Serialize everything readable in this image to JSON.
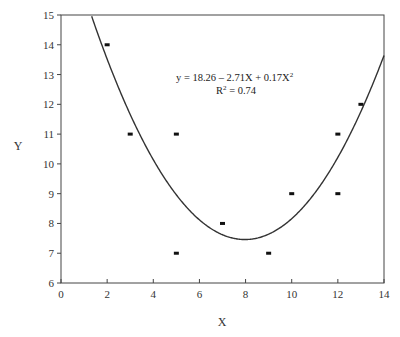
{
  "chart_data": {
    "type": "scatter",
    "title": "",
    "xlabel": "X",
    "ylabel": "Y",
    "xlim": [
      0,
      14
    ],
    "ylim": [
      6,
      15
    ],
    "xticks": [
      0,
      2,
      4,
      6,
      8,
      10,
      12,
      14
    ],
    "yticks": [
      6,
      7,
      8,
      9,
      10,
      11,
      12,
      13,
      14,
      15
    ],
    "grid": false,
    "legend": null,
    "series": [
      {
        "name": "observations",
        "type": "scatter",
        "points": [
          {
            "x": 2,
            "y": 14
          },
          {
            "x": 3,
            "y": 11
          },
          {
            "x": 5,
            "y": 11
          },
          {
            "x": 5,
            "y": 7
          },
          {
            "x": 7,
            "y": 8
          },
          {
            "x": 9,
            "y": 7
          },
          {
            "x": 10,
            "y": 9
          },
          {
            "x": 12,
            "y": 11
          },
          {
            "x": 12,
            "y": 9
          },
          {
            "x": 13,
            "y": 12
          }
        ]
      },
      {
        "name": "quadratic fit",
        "type": "line",
        "coefficients": {
          "a": 0.17,
          "b": -2.71,
          "c": 18.26
        }
      }
    ],
    "annotations": [
      {
        "text": "y = 18.26 - 2.71X + 0.17X²",
        "x": 10,
        "y": 12.5
      },
      {
        "text": "R² = 0.74",
        "x": 10,
        "y": 12
      }
    ]
  },
  "labels": {
    "xlabel": "X",
    "ylabel": "Y",
    "equation_prefix": "y = 18.26 – 2.71X + 0.17X",
    "equation_exp": "2",
    "r2_prefix": "R",
    "r2_exp": "2",
    "r2_value": " = 0.74"
  }
}
